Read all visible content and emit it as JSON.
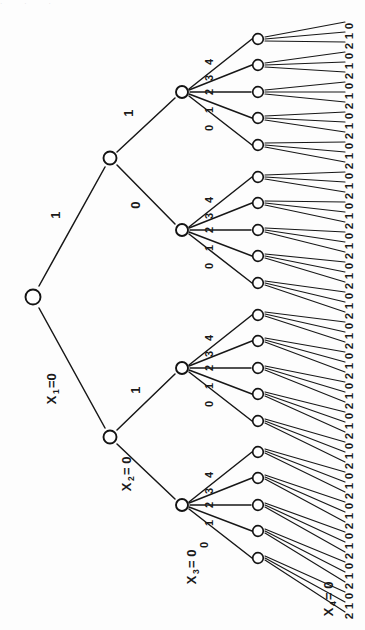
{
  "figure": {
    "background_color": "#fdfdfd",
    "ink_color": "#171717",
    "node_fill": "#ffffff",
    "top_edge_artifact": "· · ·"
  },
  "variables": {
    "level1": "X",
    "level1_sub": "1",
    "level1_eq": "=0",
    "level2": "X",
    "level2_sub": "2",
    "level2_eq": "= 0",
    "level3": "X",
    "level3_sub": "3",
    "level3_eq": "= 0",
    "level4": "X",
    "level4_sub": "4",
    "level4_eq": "= 0"
  },
  "branch_labels": {
    "level1": [
      "0",
      "1"
    ],
    "level1_shown": "1",
    "level2": [
      "0",
      "1"
    ],
    "level2_upper_shown": "0",
    "level2_lower_shown": "1",
    "level3": [
      "0",
      "1",
      "2",
      "3",
      "4"
    ],
    "level4": [
      "0",
      "1",
      "2"
    ]
  },
  "tree": {
    "depth": 4,
    "root_children": 2,
    "level2_children_each": 2,
    "level3_children_each": 5,
    "level4_children_each": 3,
    "total_leaves": 60,
    "node_counts": [
      1,
      2,
      4,
      20,
      60
    ]
  },
  "level3_fan_labels_bottom_to_top": [
    "0",
    "1",
    "2",
    "3",
    "4"
  ],
  "leaf_label_sequence": [
    "0",
    "1",
    "2",
    "0",
    "1",
    "2",
    "0",
    "1",
    "2",
    "0",
    "1",
    "2",
    "0",
    "1",
    "2",
    "0",
    "1",
    "2",
    "0",
    "1",
    "2",
    "0",
    "1",
    "2",
    "0",
    "1",
    "2",
    "0",
    "1",
    "2",
    "0",
    "1",
    "2",
    "0",
    "1",
    "2",
    "0",
    "1",
    "2",
    "0",
    "1",
    "2",
    "0",
    "1",
    "2",
    "0",
    "1",
    "2",
    "0",
    "1",
    "2",
    "0",
    "1",
    "2",
    "0",
    "1",
    "2",
    "0",
    "1",
    "2"
  ],
  "chart_data": {
    "type": "diagram",
    "levels": [
      {
        "variable": "X1",
        "domain": [
          "0",
          "1"
        ]
      },
      {
        "variable": "X2",
        "domain": [
          "0",
          "1"
        ]
      },
      {
        "variable": "X3",
        "domain": [
          "0",
          "1",
          "2",
          "3",
          "4"
        ]
      },
      {
        "variable": "X4",
        "domain": [
          "0",
          "1",
          "2"
        ]
      }
    ],
    "branching_factors": [
      2,
      2,
      5,
      3
    ],
    "leaf_count": 60
  }
}
